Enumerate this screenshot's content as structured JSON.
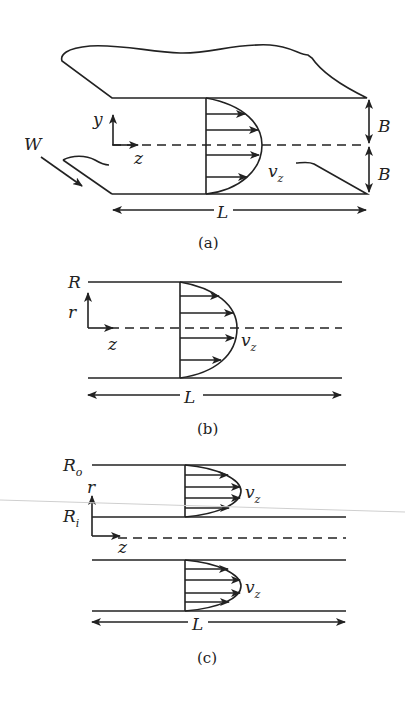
{
  "figure": {
    "panels": [
      {
        "id": "a",
        "caption": "(a)",
        "description": "Flow between parallel plates",
        "labels": {
          "y_axis": "y",
          "z_axis": "z",
          "width": "W",
          "half_gap_top": "B",
          "half_gap_bottom": "B",
          "velocity": "v",
          "velocity_sub": "z",
          "length": "L"
        }
      },
      {
        "id": "b",
        "caption": "(b)",
        "description": "Flow in a circular tube",
        "labels": {
          "radius": "R",
          "r_axis": "r",
          "z_axis": "z",
          "velocity": "v",
          "velocity_sub": "z",
          "length": "L"
        }
      },
      {
        "id": "c",
        "caption": "(c)",
        "description": "Flow in an annulus",
        "labels": {
          "outer_radius": "R",
          "outer_radius_sub": "o",
          "inner_radius": "R",
          "inner_radius_sub": "i",
          "r_axis": "r",
          "z_axis": "z",
          "velocity_top": "v",
          "velocity_top_sub": "z",
          "velocity_bottom": "v",
          "velocity_bottom_sub": "z",
          "length": "L"
        }
      }
    ]
  }
}
